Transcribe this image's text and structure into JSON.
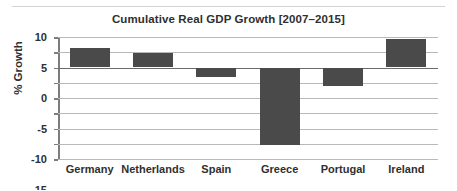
{
  "chart_data": {
    "type": "bar",
    "title": "Cumulative Real GDP Growth [2007–2015]",
    "xlabel": "",
    "ylabel": "% Growth",
    "categories": [
      "Germany",
      "Netherlands",
      "Spain",
      "Greece",
      "Portugal",
      "Ireland"
    ],
    "values": [
      6.5,
      4.8,
      -3.0,
      -25.5,
      -6.0,
      9.2
    ],
    "ylim": [
      -30,
      10
    ],
    "yticks": [
      10,
      5,
      0,
      -5,
      -10,
      -15,
      -20,
      -25,
      -30
    ],
    "ytick_labels": [
      "10",
      "5",
      "0",
      "-5",
      "-10",
      "-15",
      "-20",
      "-25",
      "-30"
    ],
    "grid": true,
    "legend": false,
    "bar_color": "#4a4a4a",
    "gridline_color": "#b9b9b9",
    "zero_line_color": "#6a6a6a",
    "axis_color": "#7d7d7d",
    "background": "#ffffff"
  }
}
